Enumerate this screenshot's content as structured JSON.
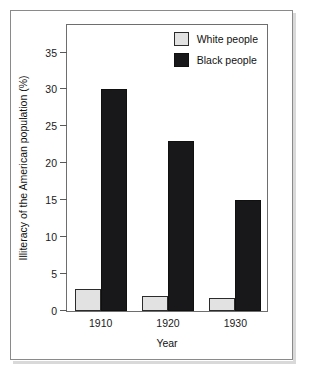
{
  "chart_data": {
    "type": "bar",
    "title": "",
    "xlabel": "Year",
    "ylabel": "Illiteracy of the American population (%)",
    "categories": [
      "1910",
      "1920",
      "1930"
    ],
    "series": [
      {
        "name": "White people",
        "color": "#e2e2e2",
        "values": [
          3,
          2,
          1.8
        ]
      },
      {
        "name": "Black people",
        "color": "#18181a",
        "values": [
          30,
          23,
          15
        ]
      }
    ],
    "ylim": [
      0,
      39
    ],
    "yticks": [
      0,
      5,
      10,
      15,
      20,
      25,
      30,
      35
    ],
    "ytick_labels": [
      "0",
      "5",
      "10",
      "15",
      "20",
      "25",
      "30",
      "35"
    ],
    "grid": false,
    "legend_position": "top-right"
  },
  "legend": {
    "items": [
      {
        "label": "White people",
        "swatch": "white-swatch"
      },
      {
        "label": "Black people",
        "swatch": "black-swatch"
      }
    ]
  }
}
